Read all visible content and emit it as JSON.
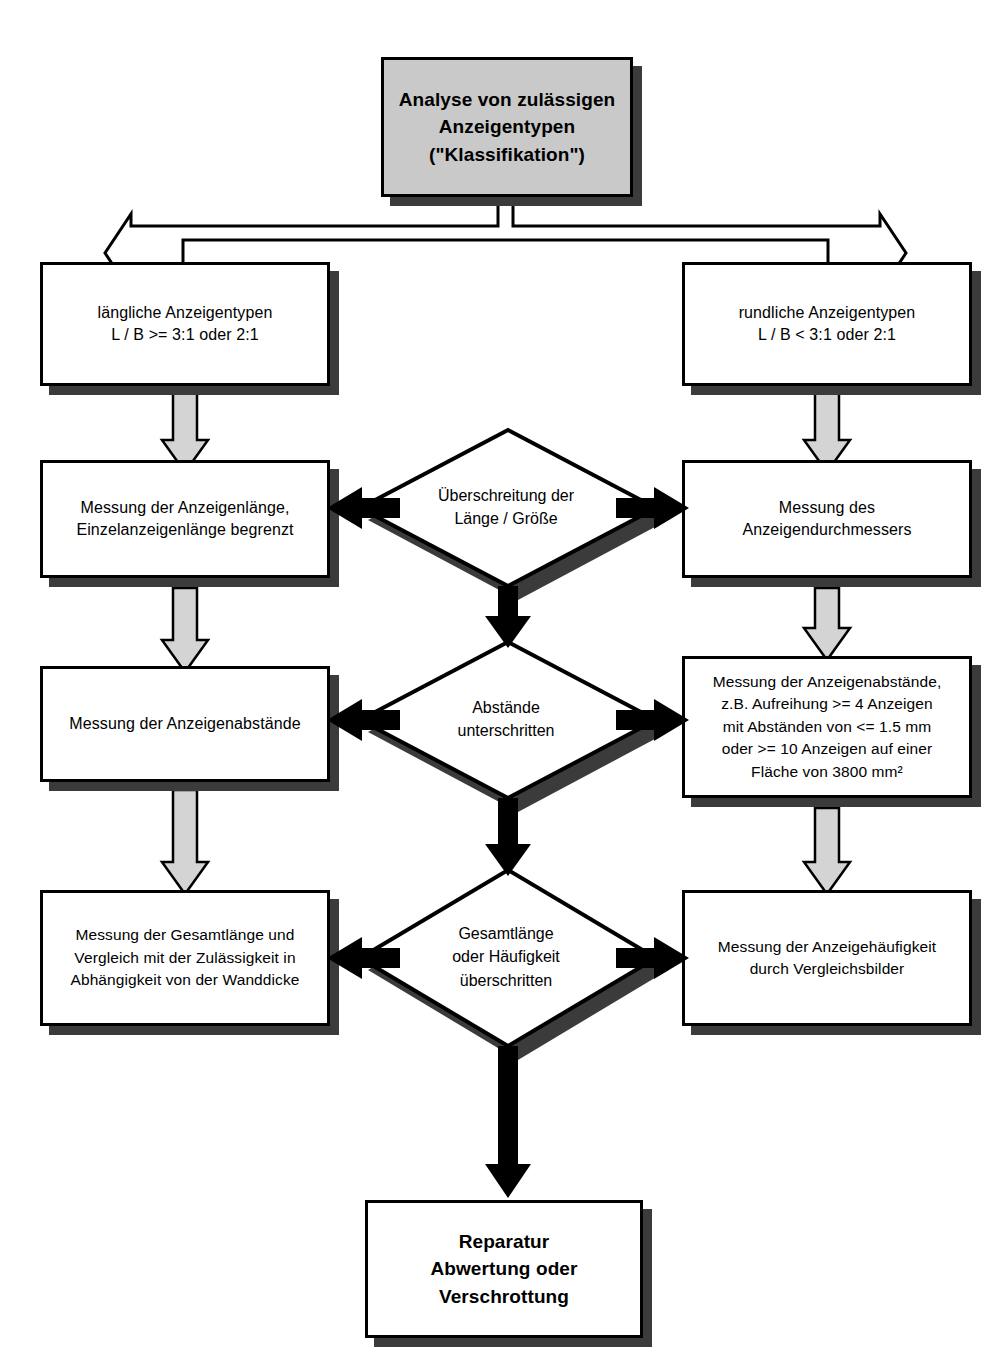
{
  "diagram": {
    "title_node": {
      "id": "klassifikation",
      "text": "Analyse von zulässigen\nAnzeigentypen\n(\"Klassifikation\")",
      "fill": "#c9c9c9"
    },
    "branches": {
      "left_label": "längliche Anzeigentypen\nL / B >= 3:1 oder 2:1",
      "right_label": "rundliche Anzeigentypen\nL / B <  3:1 oder 2:1"
    },
    "left_column": [
      {
        "id": "left-1",
        "text": "längliche Anzeigentypen\nL / B >= 3:1 oder 2:1"
      },
      {
        "id": "left-2",
        "text": "Messung der Anzeigenlänge,\nEinzelanzeigenlänge begrenzt"
      },
      {
        "id": "left-3",
        "text": "Messung der Anzeigenabstände"
      },
      {
        "id": "left-4",
        "text": "Messung der Gesamtlänge und\nVergleich mit der Zulässigkeit in\nAbhängigkeit von der Wanddicke"
      }
    ],
    "right_column": [
      {
        "id": "right-1",
        "text": "rundliche Anzeigentypen\nL / B <  3:1 oder 2:1"
      },
      {
        "id": "right-2",
        "text": "Messung des\nAnzeigendurchmessers"
      },
      {
        "id": "right-3",
        "text": "Messung der Anzeigenabstände,\nz.B. Aufreihung >= 4 Anzeigen\nmit Abständen von <= 1.5 mm\noder >= 10 Anzeigen auf einer\nFläche von 3800 mm²"
      },
      {
        "id": "right-4",
        "text": "Messung der Anzeigehäufigkeit\ndurch Vergleichsbilder"
      }
    ],
    "decisions": [
      {
        "id": "decision-1",
        "text": "Überschreitung der\nLänge / Größe"
      },
      {
        "id": "decision-2",
        "text": "Abstände\nunterschritten"
      },
      {
        "id": "decision-3",
        "text": "Gesamtlänge\noder Häufigkeit\nüberschritten"
      }
    ],
    "terminal_node": {
      "id": "reparatur",
      "text": "Reparatur\nAbwertung oder\nVerschrottung"
    },
    "colors": {
      "node_fill": "#ffffff",
      "title_fill": "#c9c9c9",
      "outline": "#000000",
      "shadow": "#3b3b3b",
      "gray_arrow_fill": "#d4d4d4",
      "black_arrow_fill": "#000000"
    }
  }
}
